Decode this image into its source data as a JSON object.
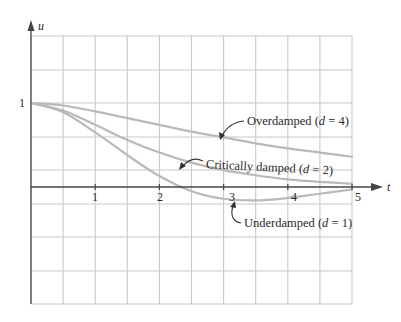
{
  "chart_data": {
    "type": "line",
    "title": "",
    "xlabel": "t",
    "ylabel": "u",
    "xlim": [
      0,
      5
    ],
    "ylim": [
      -1.4,
      1.8
    ],
    "grid": true,
    "x_ticks": [
      "1",
      "2",
      "3",
      "4",
      "5"
    ],
    "y_ticks": [
      "1"
    ],
    "series": [
      {
        "name": "Overdamped (d = 4)",
        "d": 4,
        "x": [
          0,
          0.5,
          1,
          1.5,
          2,
          2.5,
          3,
          3.5,
          4,
          4.5,
          5
        ],
        "values": [
          1,
          0.97,
          0.9,
          0.82,
          0.74,
          0.66,
          0.59,
          0.52,
          0.46,
          0.41,
          0.36
        ]
      },
      {
        "name": "Critically damped (d = 2)",
        "d": 2,
        "x": [
          0,
          0.5,
          1,
          1.5,
          2,
          2.5,
          3,
          3.5,
          4,
          4.5,
          5
        ],
        "values": [
          1,
          0.91,
          0.74,
          0.56,
          0.41,
          0.29,
          0.2,
          0.14,
          0.09,
          0.06,
          0.04
        ]
      },
      {
        "name": "Underdamped (d = 1)",
        "d": 1,
        "x": [
          0,
          0.5,
          1,
          1.5,
          2,
          2.5,
          3,
          3.5,
          4,
          4.5,
          5
        ],
        "values": [
          1,
          0.89,
          0.65,
          0.38,
          0.13,
          -0.05,
          -0.14,
          -0.16,
          -0.13,
          -0.08,
          -0.03
        ]
      }
    ],
    "annotations": [
      {
        "text": "Overdamped (d = 4)",
        "points_to": "Overdamped (d = 4)"
      },
      {
        "text": "Critically damped (d = 2)",
        "points_to": "Critically damped (d = 2)"
      },
      {
        "text": "Underdamped (d = 1)",
        "points_to": "Underdamped (d = 1)"
      }
    ],
    "legend": "none (inline arrow annotations)"
  },
  "labels": {
    "y_axis": "u",
    "x_axis": "t",
    "y_tick_1": "1",
    "x_ticks": [
      "1",
      "2",
      "3",
      "4",
      "5"
    ],
    "overdamped": {
      "pre": "Overdamped (",
      "var": "d",
      "post": " = 4)"
    },
    "critical": {
      "pre": "Critically damped (",
      "var": "d",
      "post": " = 2)"
    },
    "underdamped": {
      "pre": "Underdamped (",
      "var": "d",
      "post": " = 1)"
    }
  },
  "colors": {
    "grid": "#c8c8c8",
    "axis": "#444444",
    "curve": "#b9b9b9",
    "text": "#2a2a2a"
  }
}
